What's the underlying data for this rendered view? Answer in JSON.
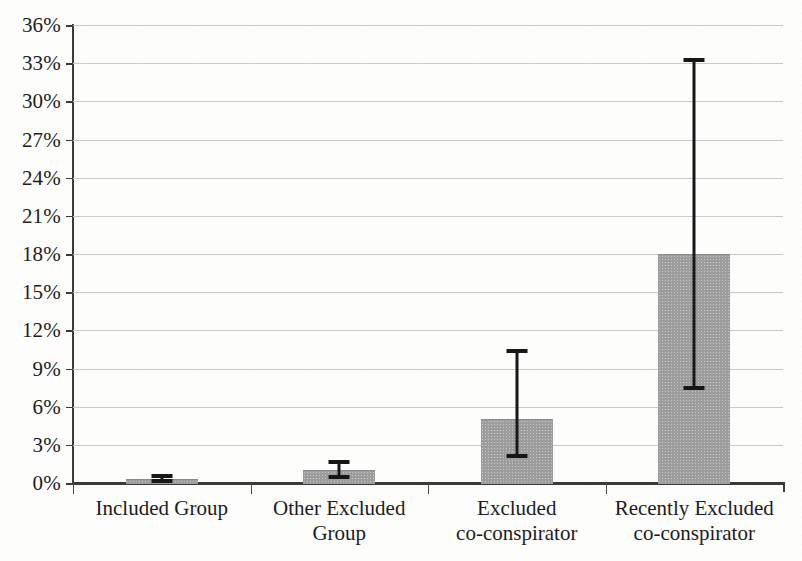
{
  "chart_data": {
    "type": "bar",
    "title": "",
    "subtitle": "",
    "xlabel": "",
    "ylabel": "",
    "categories": [
      "Included Group",
      "Other Excluded Group",
      "Excluded co-conspirator",
      "Recently Excluded co-conspirator"
    ],
    "category_lines": [
      [
        "Included Group"
      ],
      [
        "Other Excluded",
        "Group"
      ],
      [
        "Excluded",
        "co-conspirator"
      ],
      [
        "Recently Excluded",
        "co-conspirator"
      ]
    ],
    "values": [
      0.3,
      1.0,
      5.0,
      18.0
    ],
    "error_low": [
      0.0,
      0.3,
      2.0,
      7.3
    ],
    "error_high": [
      0.7,
      1.8,
      10.5,
      33.4
    ],
    "value_unit": "%",
    "ylim": [
      0,
      36
    ],
    "ytick_values": [
      0,
      3,
      6,
      9,
      12,
      15,
      18,
      21,
      24,
      27,
      30,
      33,
      36
    ],
    "ytick_labels": [
      "0%",
      "3%",
      "6%",
      "9%",
      "12%",
      "15%",
      "18%",
      "21%",
      "24%",
      "27%",
      "30%",
      "33%",
      "36%"
    ],
    "grid": true,
    "legend": "none",
    "series_name": "",
    "bar_color": "#9d9d9d",
    "error_color": "#171717",
    "grid_color": "#c9c9c9",
    "axis_color": "#3a3a3a",
    "background_color": "#fdfdfc"
  }
}
